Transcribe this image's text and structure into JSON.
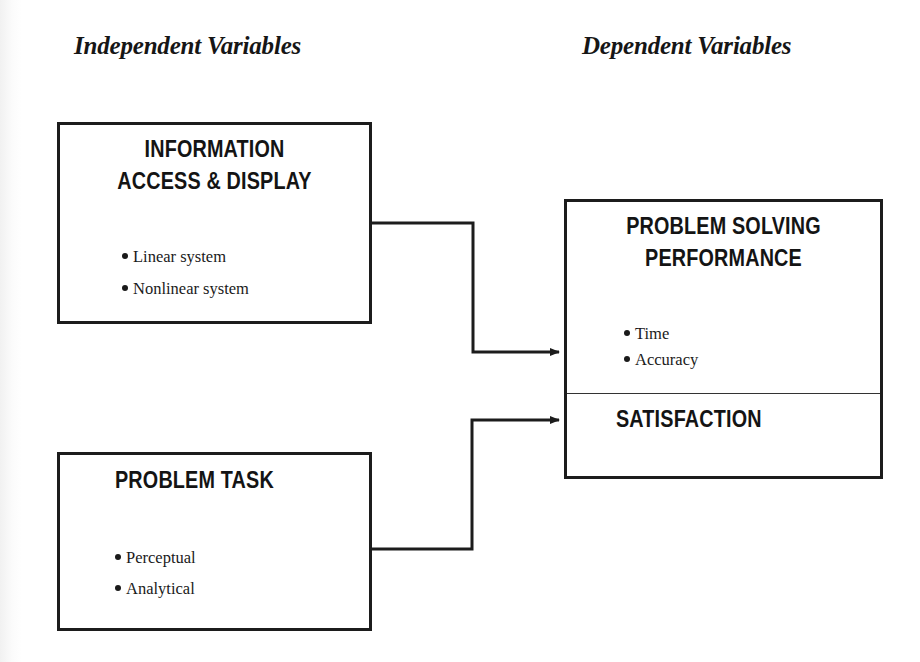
{
  "headings": {
    "independent": "Independent Variables",
    "dependent": "Dependent Variables"
  },
  "boxes": {
    "information": {
      "title_line1": "INFORMATION",
      "title_line2": "ACCESS & DISPLAY",
      "bullets": [
        "Linear system",
        "Nonlinear system"
      ]
    },
    "task": {
      "title": "PROBLEM TASK",
      "bullets": [
        "Perceptual",
        "Analytical"
      ]
    },
    "dependent": {
      "performance_title_line1": "PROBLEM SOLVING",
      "performance_title_line2": "PERFORMANCE",
      "performance_bullets": [
        "Time",
        "Accuracy"
      ],
      "satisfaction_title": "SATISFACTION"
    }
  },
  "connectors": [
    {
      "from": "INFORMATION ACCESS & DISPLAY",
      "to": "PROBLEM SOLVING PERFORMANCE"
    },
    {
      "from": "PROBLEM TASK",
      "to": "SATISFACTION"
    }
  ],
  "colors": {
    "line": "#1c1c1c",
    "text": "#151515",
    "background": "#ffffff"
  }
}
